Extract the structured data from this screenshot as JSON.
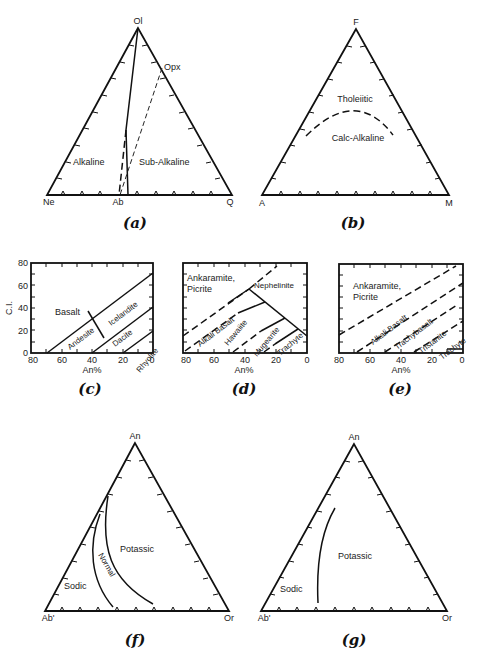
{
  "figure": {
    "panels": {
      "a": {
        "caption": "(a)",
        "vertices": {
          "top": "Ol",
          "left": "Ne",
          "right": "Q"
        },
        "base_point": "Ab",
        "edge_point": "Opx",
        "regions": [
          "Alkaline",
          "Sub-Alkaline"
        ]
      },
      "b": {
        "caption": "(b)",
        "vertices": {
          "top": "F",
          "left": "A",
          "right": "M"
        },
        "regions": [
          "Tholeiitic",
          "Calc-Alkaline"
        ]
      },
      "c": {
        "caption": "(c)",
        "ylabel": "C.I.",
        "xlabel": "An%",
        "yticks": [
          "0",
          "20",
          "40",
          "60",
          "80"
        ],
        "xticks": [
          "80",
          "60",
          "40",
          "20",
          "0"
        ],
        "regions": [
          "Basalt",
          "Andesite",
          "Icelandite",
          "Dacite",
          "Rhyolite"
        ]
      },
      "d": {
        "caption": "(d)",
        "xlabel": "An%",
        "xticks": [
          "80",
          "60",
          "40",
          "20",
          "0"
        ],
        "regions": [
          "Ankaramite,",
          "Picrite",
          "Nephelinite",
          "Alkali Basalt",
          "Hawaiite",
          "Mugearite",
          "Trachyte"
        ]
      },
      "e": {
        "caption": "(e)",
        "xlabel": "An%",
        "xticks": [
          "80",
          "60",
          "40",
          "20",
          "0"
        ],
        "regions": [
          "Ankaramite,",
          "Picrite",
          "Alkali Basalt",
          "Trachybasalt",
          "Tristanite",
          "Trachyte"
        ]
      },
      "f": {
        "caption": "(f)",
        "vertices": {
          "top": "An",
          "left": "Ab'",
          "right": "Or"
        },
        "regions": [
          "Sodic",
          "Normal",
          "Potassic"
        ]
      },
      "g": {
        "caption": "(g)",
        "vertices": {
          "top": "An",
          "left": "Ab'",
          "right": "Or"
        },
        "regions": [
          "Sodic",
          "Potassic"
        ]
      }
    }
  }
}
